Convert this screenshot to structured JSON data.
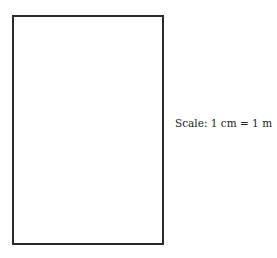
{
  "diagram": {
    "shape": {
      "type": "rectangle",
      "border_color": "#2a2a2a",
      "fill_color": "#ffffff"
    },
    "scale_label": "Scale: 1 cm = 1 m"
  }
}
